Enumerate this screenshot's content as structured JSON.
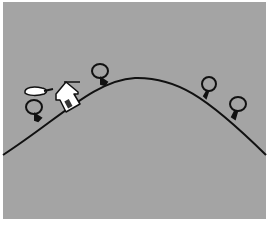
{
  "scene": {
    "description": "Illustration of a hill with a small house and four round trees",
    "colors": {
      "background": "#a4a4a4",
      "outer_margin": "#ffffff",
      "line": "#111111",
      "house": "#ffffff",
      "smoke": "#ffffff"
    },
    "hill": {
      "start": [
        3,
        155
      ],
      "peak": [
        135,
        78
      ],
      "end": [
        266,
        155
      ]
    },
    "house": {
      "x": 65,
      "y": 94,
      "rotation_deg": -30
    },
    "smoke": {
      "cx": 34,
      "cy": 91
    },
    "trees": [
      {
        "name": "tree-left",
        "cx": 34,
        "cy": 107,
        "r": 8
      },
      {
        "name": "tree-top-left",
        "cx": 100,
        "cy": 71,
        "r": 8
      },
      {
        "name": "tree-right",
        "cx": 209,
        "cy": 84,
        "r": 7
      },
      {
        "name": "tree-far-right",
        "cx": 238,
        "cy": 104,
        "r": 8
      }
    ]
  }
}
